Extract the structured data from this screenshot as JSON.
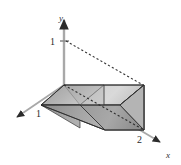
{
  "figure": {
    "title": "",
    "background_color": "#ffffff",
    "axes": [
      {
        "name": "y-axis",
        "label": "y",
        "label_x": 59,
        "label_y": 21,
        "direction": "up"
      },
      {
        "name": "x-axis",
        "label": "x",
        "label_x": 168,
        "label_y": 157,
        "direction": "down-right"
      },
      {
        "name": "z-axis",
        "label": "",
        "label_x": 0,
        "label_y": 0,
        "direction": "down-left"
      }
    ],
    "ticks": [
      {
        "name": "y-tick-1",
        "label": "1",
        "label_x": 53,
        "label_y": 43,
        "axis": "y"
      },
      {
        "name": "z-tick-1",
        "label": "1",
        "label_x": 38,
        "label_y": 116,
        "axis": "z"
      },
      {
        "name": "x-tick-2",
        "label": "2",
        "label_x": 139,
        "label_y": 142,
        "axis": "x"
      }
    ],
    "colors": {
      "axis": "#9a9a9a",
      "axis_dark": "#4a4a4a",
      "outline": "#2e2e2e",
      "dashed": "#3a3a3a",
      "top_face_light": "#d8d8d8",
      "top_face_mid": "#bdbdbd",
      "top_face_dark": "#a7a7a7",
      "front_face_light": "#c2c2c2",
      "front_face_mid": "#9d9d9d",
      "front_face_dark": "#8a8a8a",
      "bottom_face": "#8e8e8e",
      "right_face": "#b2b2b2",
      "inner_face": "#a0a0a0"
    },
    "geometry": {
      "description": "solid-wedge-prism-in-3d-axes",
      "y_axis_top": {
        "x": 64,
        "y": 16
      },
      "y_axis_bottom": {
        "x": 64,
        "y": 110
      },
      "y_one_point": {
        "x": 64,
        "y": 41
      },
      "origin": {
        "x": 64,
        "y": 85
      },
      "x_axis_end": {
        "x": 164,
        "y": 144
      },
      "z_axis_end": {
        "x": 13,
        "y": 119
      },
      "solid_top_left": {
        "x": 41,
        "y": 105
      },
      "solid_top_right": {
        "x": 144,
        "y": 85
      },
      "solid_bottom_right": {
        "x": 144,
        "y": 130
      }
    },
    "dashed_segments": [
      {
        "name": "hypotenuse-dashed",
        "x1": 66,
        "y1": 41,
        "x2": 143,
        "y2": 85
      },
      {
        "name": "diagonal-dashed",
        "x1": 64,
        "y1": 85,
        "x2": 143,
        "y2": 129
      }
    ]
  }
}
